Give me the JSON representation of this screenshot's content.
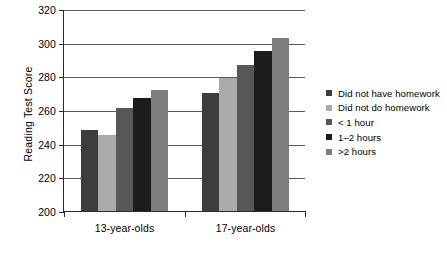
{
  "chart_data": {
    "type": "bar",
    "title": "",
    "xlabel": "",
    "ylabel": "Reading Test Score",
    "categories": [
      "13-year-olds",
      "17-year-olds"
    ],
    "ylim": [
      200,
      320
    ],
    "ytick_step": 20,
    "ytick_labels": [
      "200",
      "220",
      "240",
      "260",
      "280",
      "300",
      "320"
    ],
    "ytick_values": [
      200,
      220,
      240,
      260,
      280,
      300,
      320
    ],
    "grid": true,
    "grid_axis": "y",
    "legend_position": "right",
    "series": [
      {
        "name": "Did not have homework",
        "color": "#3d3d3d",
        "values": [
          248,
          270
        ]
      },
      {
        "name": "Did not do homework",
        "color": "#aaaaaa",
        "values": [
          245,
          279
        ]
      },
      {
        "name": "< 1 hour",
        "color": "#575757",
        "values": [
          261,
          287
        ]
      },
      {
        "name": "1–2 hours",
        "color": "#1c1c1c",
        "values": [
          267,
          295
        ]
      },
      {
        "name": ">2 hours",
        "color": "#7d7d7d",
        "values": [
          272,
          303
        ]
      }
    ]
  },
  "colors": {
    "axis": "#2b2b2b",
    "gridline": "#5a5a5a",
    "background": "#ffffff",
    "text": "#000000"
  }
}
